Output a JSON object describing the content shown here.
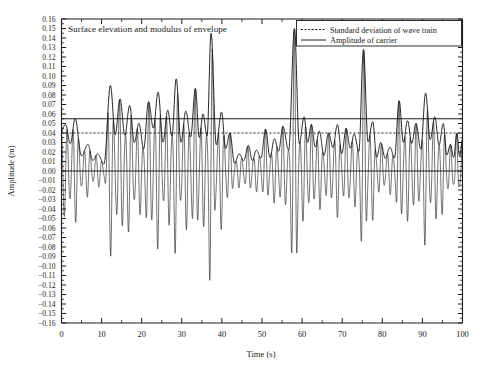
{
  "chart_data": {
    "type": "line",
    "title": "Surface elevation and modulus of envelope",
    "xlabel": "Time (s)",
    "ylabel": "Amplitude (m)",
    "xlim": [
      0,
      100
    ],
    "ylim": [
      -0.16,
      0.16
    ],
    "grid": false,
    "legend_position": "top-right",
    "x_ticks": [
      0,
      10,
      20,
      30,
      40,
      50,
      60,
      70,
      80,
      90,
      100
    ],
    "x_tick_labels": [
      "0",
      "10",
      "20",
      "30",
      "40",
      "50",
      "60",
      "70",
      "80",
      "90",
      "100"
    ],
    "x_minor_tick_step": 5,
    "y_ticks": [
      0.16,
      0.15,
      0.14,
      0.13,
      0.12,
      0.11,
      0.1,
      0.09,
      0.08,
      0.07,
      0.06,
      0.05,
      0.04,
      0.03,
      0.02,
      0.01,
      0.0,
      -0.01,
      -0.02,
      -0.03,
      -0.04,
      -0.05,
      -0.06,
      -0.07,
      -0.08,
      -0.09,
      -0.1,
      -0.11,
      -0.12,
      -0.13,
      -0.14,
      -0.15,
      -0.16
    ],
    "y_tick_labels": [
      "0.16",
      "0.15",
      "0.14",
      "0.13",
      "0.12",
      "0.11",
      "0.10",
      "0.09",
      "0.08",
      "0.07",
      "0.06",
      "0.05",
      "0.04",
      "0.03",
      "0.02",
      "0.01",
      "0.00",
      "−0.01",
      "−0.02",
      "−0.03",
      "−0.04",
      "−0.05",
      "−0.06",
      "−0.07",
      "−0.08",
      "−0.09",
      "−0.10",
      "−0.11",
      "−0.12",
      "−0.13",
      "−0.14",
      "−0.15",
      "−0.16"
    ],
    "y_minor_tick_step": 0.005,
    "legend": [
      {
        "label": "Standard deviation of wave train",
        "style": "dotted"
      },
      {
        "label": "Amplitude of carrier",
        "style": "solid"
      }
    ],
    "reference_lines": [
      {
        "name": "amplitude-of-carrier",
        "value": 0.055,
        "style": "solid"
      },
      {
        "name": "standard-deviation-of-wave-train",
        "value": 0.04,
        "style": "dotted"
      },
      {
        "name": "zero-line",
        "value": 0.0,
        "style": "solid"
      }
    ],
    "series": [
      {
        "name": "Surface elevation",
        "style": "solid-thin",
        "description": "Narrow-band random wave train: rapidly oscillating carrier modulated by the envelope"
      },
      {
        "name": "Modulus of envelope",
        "style": "solid-thick",
        "description": "Smooth positive envelope bounding the surface elevation"
      }
    ],
    "carrier_period_s": 1.45,
    "envelope_peaks": [
      {
        "t": 1.0,
        "a": 0.049
      },
      {
        "t": 3.4,
        "a": 0.055
      },
      {
        "t": 6.6,
        "a": 0.028
      },
      {
        "t": 9.0,
        "a": 0.018
      },
      {
        "t": 12.2,
        "a": 0.09
      },
      {
        "t": 14.6,
        "a": 0.076
      },
      {
        "t": 17.0,
        "a": 0.069
      },
      {
        "t": 19.3,
        "a": 0.05
      },
      {
        "t": 21.7,
        "a": 0.073
      },
      {
        "t": 24.1,
        "a": 0.083
      },
      {
        "t": 26.5,
        "a": 0.064
      },
      {
        "t": 28.6,
        "a": 0.097
      },
      {
        "t": 31.0,
        "a": 0.063
      },
      {
        "t": 33.4,
        "a": 0.087
      },
      {
        "t": 35.3,
        "a": 0.06
      },
      {
        "t": 37.3,
        "a": 0.145
      },
      {
        "t": 39.9,
        "a": 0.062
      },
      {
        "t": 42.0,
        "a": 0.04
      },
      {
        "t": 44.3,
        "a": 0.018
      },
      {
        "t": 46.6,
        "a": 0.027
      },
      {
        "t": 48.6,
        "a": 0.022
      },
      {
        "t": 50.9,
        "a": 0.044
      },
      {
        "t": 53.1,
        "a": 0.034
      },
      {
        "t": 55.2,
        "a": 0.047
      },
      {
        "t": 58.1,
        "a": 0.15
      },
      {
        "t": 60.5,
        "a": 0.057
      },
      {
        "t": 62.3,
        "a": 0.049
      },
      {
        "t": 64.3,
        "a": 0.042
      },
      {
        "t": 66.6,
        "a": 0.04
      },
      {
        "t": 68.8,
        "a": 0.049
      },
      {
        "t": 71.0,
        "a": 0.045
      },
      {
        "t": 73.0,
        "a": 0.039
      },
      {
        "t": 75.3,
        "a": 0.128
      },
      {
        "t": 77.6,
        "a": 0.052
      },
      {
        "t": 79.6,
        "a": 0.03
      },
      {
        "t": 81.9,
        "a": 0.025
      },
      {
        "t": 84.2,
        "a": 0.074
      },
      {
        "t": 86.3,
        "a": 0.053
      },
      {
        "t": 88.4,
        "a": 0.05
      },
      {
        "t": 90.8,
        "a": 0.082
      },
      {
        "t": 93.1,
        "a": 0.057
      },
      {
        "t": 95.2,
        "a": 0.05
      },
      {
        "t": 97.0,
        "a": 0.028
      },
      {
        "t": 98.6,
        "a": 0.04
      },
      {
        "t": 100.0,
        "a": 0.033
      }
    ]
  }
}
